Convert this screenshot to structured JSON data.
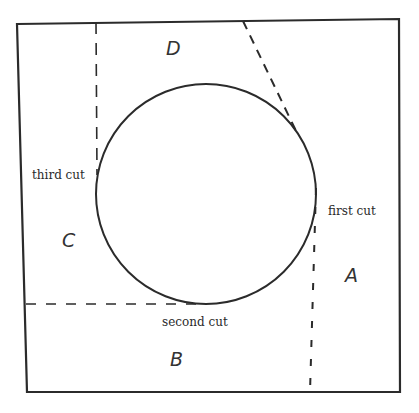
{
  "diagram": {
    "colors": {
      "stroke": "#2b2b2b",
      "background": "#ffffff"
    },
    "square": {
      "corners": [
        [
          17,
          24
        ],
        [
          399,
          19
        ],
        [
          400,
          392
        ],
        [
          27,
          392
        ]
      ]
    },
    "circle": {
      "cx": 206,
      "cy": 194,
      "r": 110
    },
    "cuts": [
      {
        "id": "first",
        "label": "first cut",
        "style": "dashed"
      },
      {
        "id": "second",
        "label": "second cut",
        "style": "dashed"
      },
      {
        "id": "third",
        "label": "third cut",
        "style": "dashed"
      }
    ],
    "regions": [
      {
        "id": "A",
        "label": "A"
      },
      {
        "id": "B",
        "label": "B"
      },
      {
        "id": "C",
        "label": "C"
      },
      {
        "id": "D",
        "label": "D"
      }
    ]
  }
}
